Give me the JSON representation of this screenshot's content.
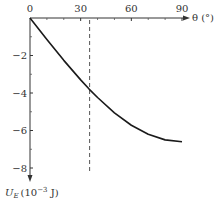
{
  "chart_data": {
    "type": "line",
    "title": "",
    "xlabel": "θ (°)",
    "ylabel": "U_E (10⁻³ J)",
    "ylabel_parts": {
      "symbol": "U",
      "sub": "E",
      "unit_pre": "(10",
      "unit_exp": "−3",
      "unit_post": " J)"
    },
    "xlim": [
      0,
      90
    ],
    "ylim": [
      -8,
      0
    ],
    "x_ticks": [
      0,
      30,
      60,
      90
    ],
    "x_tick_labels": [
      "0",
      "30",
      "60",
      "90"
    ],
    "x_minor_ticks": [
      10,
      20,
      40,
      50,
      70,
      80
    ],
    "y_ticks": [
      -2,
      -4,
      -6,
      -8
    ],
    "y_tick_labels": [
      "−2",
      "−4",
      "−6",
      "−8"
    ],
    "y_minor_ticks": [
      -1,
      -3,
      -5,
      -7
    ],
    "grid": false,
    "series": [
      {
        "name": "U_E",
        "style": "solid",
        "x": [
          0,
          10,
          20,
          30,
          35,
          40,
          50,
          60,
          70,
          80,
          90
        ],
        "values": [
          0,
          -1.15,
          -2.26,
          -3.3,
          -3.79,
          -4.24,
          -5.06,
          -5.72,
          -6.2,
          -6.5,
          -6.6
        ]
      }
    ],
    "annotations": [
      {
        "type": "vline",
        "style": "dashed",
        "x": 35,
        "y_from": 0,
        "y_to": -8.3
      }
    ]
  }
}
